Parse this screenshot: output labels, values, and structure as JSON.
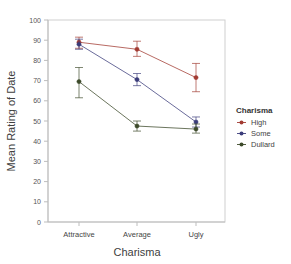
{
  "chart_data": {
    "type": "line",
    "title": "",
    "xlabel": "Charisma",
    "ylabel": "Mean Rating of Date",
    "categories": [
      "Attractive",
      "Average",
      "Ugly"
    ],
    "ylim": [
      0,
      100
    ],
    "yticks": [
      0,
      10,
      20,
      30,
      40,
      50,
      60,
      70,
      80,
      90,
      100
    ],
    "grid": false,
    "legend_position": "right",
    "legend_title": "Charisma",
    "error_bars": "95% CI",
    "series": [
      {
        "name": "High",
        "color": "#a23b32",
        "values": [
          89,
          85.5,
          71.5
        ],
        "err_low": [
          86,
          82,
          64.5
        ],
        "err_high": [
          91.5,
          89.5,
          78.5
        ]
      },
      {
        "name": "Some",
        "color": "#3b3c7a",
        "values": [
          88,
          70.5,
          49.5
        ],
        "err_low": [
          85.5,
          67.5,
          47
        ],
        "err_high": [
          90.5,
          73.5,
          52
        ]
      },
      {
        "name": "Dullard",
        "color": "#3d4a2a",
        "values": [
          69.5,
          47.5,
          46
        ],
        "err_low": [
          61.5,
          45,
          44
        ],
        "err_high": [
          76.5,
          50,
          48.5
        ]
      }
    ]
  },
  "legend": {
    "title": "Charisma",
    "entries": [
      {
        "label": "High",
        "color": "#a23b32"
      },
      {
        "label": "Some",
        "color": "#3b3c7a"
      },
      {
        "label": "Dullard",
        "color": "#3d4a2a"
      }
    ]
  },
  "axes": {
    "x_title": "Charisma",
    "y_title": "Mean Rating of Date",
    "x_categories": [
      "Attractive",
      "Average",
      "Ugly"
    ],
    "y_ticks": [
      "0",
      "10",
      "20",
      "30",
      "40",
      "50",
      "60",
      "70",
      "80",
      "90",
      "100"
    ]
  },
  "colors": {
    "panel_border": "#cfcfcf",
    "axis": "#bdbdbd",
    "background": "#ffffff"
  }
}
